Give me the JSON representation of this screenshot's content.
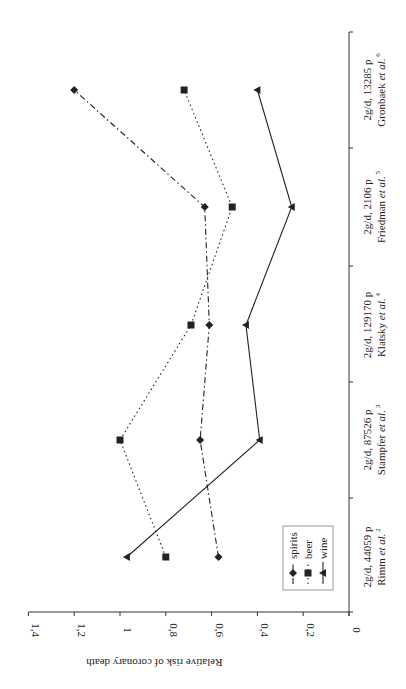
{
  "chart_data": {
    "type": "line",
    "orientation": "rotated-90-ccw",
    "title": "",
    "xlabel": "",
    "ylabel": "Relative risk of coronary death",
    "ylim": [
      0,
      1.4
    ],
    "yticks": [
      "0",
      "0,2",
      "0,4",
      "0,6",
      "0,8",
      "1",
      "1,2",
      "1,4"
    ],
    "grid": false,
    "legend_position": "inside, near Rimm category / lower values",
    "categories": [
      {
        "line1": "2g/d, 44059 p",
        "author": "Rimm",
        "suffix": " et al.",
        "ref": "2"
      },
      {
        "line1": "2g/d, 87526 p",
        "author": "Stampfer",
        "suffix": " et al.",
        "ref": "3"
      },
      {
        "line1": "2g/d, 129170 p",
        "author": "Klatsky",
        "suffix": " et al.",
        "ref": "4"
      },
      {
        "line1": "2g/d, 2106 p",
        "author": "Friedman",
        "suffix": " et al.",
        "ref": "5"
      },
      {
        "line1": "2g/d, 13285 p",
        "author": "Gronbaek",
        "suffix": " et al.",
        "ref": "6"
      }
    ],
    "series": [
      {
        "name": "spirits",
        "marker": "diamond",
        "dash": "6,3,1.5,3",
        "values": [
          0.57,
          0.65,
          0.61,
          0.63,
          1.2
        ]
      },
      {
        "name": "beer",
        "marker": "square",
        "dash": "1.5,3",
        "values": [
          0.8,
          1.0,
          0.69,
          0.51,
          0.72
        ]
      },
      {
        "name": "wine",
        "marker": "triangle",
        "dash": "",
        "values": [
          0.97,
          0.39,
          0.45,
          0.25,
          0.4
        ]
      }
    ]
  },
  "colors": {
    "line": "#222222",
    "axis": "#333333",
    "legend_border": "#999999",
    "background": "#ffffff"
  }
}
